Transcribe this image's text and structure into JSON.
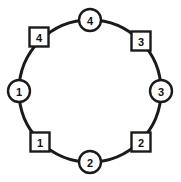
{
  "diagram": {
    "type": "ring-network",
    "title": "",
    "background_color": "#ffffff",
    "stroke_color": "#1a1a1a",
    "ring": {
      "center_x": 90,
      "center_y": 91,
      "radius": 71,
      "stroke_width": 3
    },
    "node_styles": {
      "circle_radius": 11,
      "square_size": 19,
      "node_fill": "#ffffff",
      "node_stroke": "#1a1a1a",
      "node_stroke_width": 2.4
    },
    "nodes": [
      {
        "id": "circle-4",
        "shape": "circle",
        "label": "4",
        "position": "top",
        "angle_deg": 270,
        "cx": 90,
        "cy": 20
      },
      {
        "id": "square-3",
        "shape": "square",
        "label": "3",
        "position": "top-right",
        "angle_deg": 315,
        "cx": 141,
        "cy": 41
      },
      {
        "id": "circle-3",
        "shape": "circle",
        "label": "3",
        "position": "right",
        "angle_deg": 0,
        "cx": 161,
        "cy": 91
      },
      {
        "id": "square-2",
        "shape": "square",
        "label": "2",
        "position": "bottom-right",
        "angle_deg": 45,
        "cx": 141,
        "cy": 142
      },
      {
        "id": "circle-2",
        "shape": "circle",
        "label": "2",
        "position": "bottom",
        "angle_deg": 90,
        "cx": 90,
        "cy": 162
      },
      {
        "id": "square-1",
        "shape": "square",
        "label": "1",
        "position": "bottom-left",
        "angle_deg": 135,
        "cx": 40,
        "cy": 142
      },
      {
        "id": "circle-1",
        "shape": "circle",
        "label": "1",
        "position": "left",
        "angle_deg": 180,
        "cx": 19,
        "cy": 91
      },
      {
        "id": "square-4",
        "shape": "square",
        "label": "4",
        "position": "top-left",
        "angle_deg": 225,
        "cx": 39,
        "cy": 37
      }
    ]
  }
}
